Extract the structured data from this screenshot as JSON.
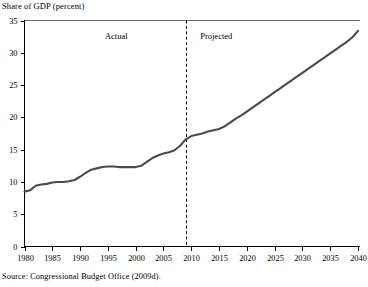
{
  "chart_data": {
    "type": "line",
    "title": "Share of GDP (percent)",
    "xlabel": "",
    "ylabel": "Share of GDP (percent)",
    "xlim": [
      1980,
      2040
    ],
    "ylim": [
      0,
      35
    ],
    "grid": false,
    "legend_position": "none",
    "y_ticks": [
      0,
      5,
      10,
      15,
      20,
      25,
      30,
      35
    ],
    "x_ticks": [
      1980,
      1985,
      1990,
      1995,
      2000,
      2005,
      2010,
      2015,
      2020,
      2025,
      2030,
      2035,
      2040
    ],
    "y_tick_labels": [
      "0",
      "5",
      "10",
      "15",
      "20",
      "25",
      "30",
      "35"
    ],
    "x_tick_labels": [
      "1980",
      "1985",
      "1990",
      "1995",
      "2000",
      "2005",
      "2010",
      "2015",
      "2020",
      "2025",
      "2030",
      "2035",
      "2040"
    ],
    "annotations": [
      {
        "text": "Actual",
        "x": 1996.5,
        "y": 32.2
      },
      {
        "text": "Projected",
        "x": 2014.5,
        "y": 32.2
      }
    ],
    "divider": {
      "x": 2009,
      "label_left": "Actual",
      "label_right": "Projected",
      "style": "dashed"
    },
    "series": [
      {
        "name": "Share of GDP",
        "color": "#4a4a4a",
        "x": [
          1980,
          1981,
          1982,
          1983,
          1984,
          1985,
          1986,
          1987,
          1988,
          1989,
          1990,
          1991,
          1992,
          1993,
          1994,
          1995,
          1996,
          1997,
          1998,
          1999,
          2000,
          2001,
          2002,
          2003,
          2004,
          2005,
          2006,
          2007,
          2008,
          2009,
          2010,
          2011,
          2012,
          2013,
          2014,
          2015,
          2016,
          2017,
          2018,
          2019,
          2020,
          2021,
          2022,
          2023,
          2024,
          2025,
          2026,
          2027,
          2028,
          2029,
          2030,
          2031,
          2032,
          2033,
          2034,
          2035,
          2036,
          2037,
          2038,
          2039,
          2040
        ],
        "y": [
          8.5,
          8.7,
          9.4,
          9.6,
          9.7,
          9.9,
          10.0,
          10.0,
          10.1,
          10.3,
          10.8,
          11.4,
          11.9,
          12.1,
          12.3,
          12.4,
          12.4,
          12.3,
          12.3,
          12.3,
          12.3,
          12.5,
          13.1,
          13.7,
          14.1,
          14.4,
          14.6,
          14.9,
          15.6,
          16.6,
          17.1,
          17.3,
          17.5,
          17.8,
          18.0,
          18.2,
          18.6,
          19.2,
          19.8,
          20.3,
          20.9,
          21.5,
          22.1,
          22.7,
          23.3,
          23.9,
          24.5,
          25.1,
          25.7,
          26.3,
          26.9,
          27.5,
          28.1,
          28.7,
          29.3,
          29.9,
          30.5,
          31.1,
          31.7,
          32.4,
          33.4
        ]
      }
    ]
  },
  "source": {
    "text": "Source:  Congressional Budget Office (2009d)."
  }
}
